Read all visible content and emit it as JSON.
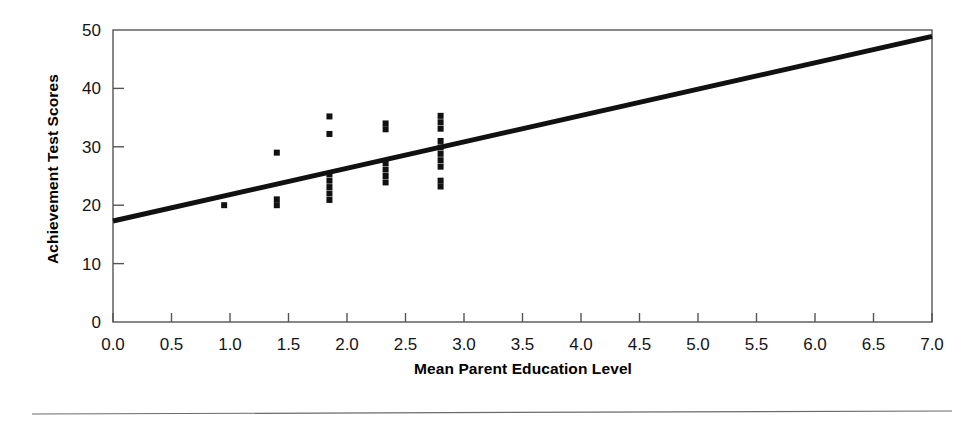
{
  "chart_data": {
    "type": "scatter",
    "title": "",
    "xlabel": "Mean Parent Education Level",
    "ylabel": "Achievement Test Scores",
    "xlim": [
      0.0,
      7.0
    ],
    "ylim": [
      0,
      50
    ],
    "grid": false,
    "legend": null,
    "x_ticks": [
      "0.0",
      "0.5",
      "1.0",
      "1.5",
      "2.0",
      "2.5",
      "3.0",
      "3.5",
      "4.0",
      "4.5",
      "5.0",
      "5.5",
      "6.0",
      "6.5",
      "7.0"
    ],
    "x_tick_values": [
      0.0,
      0.5,
      1.0,
      1.5,
      2.0,
      2.5,
      3.0,
      3.5,
      4.0,
      4.5,
      5.0,
      5.5,
      6.0,
      6.5,
      7.0
    ],
    "y_ticks": [
      "0",
      "10",
      "20",
      "30",
      "40",
      "50"
    ],
    "y_tick_values": [
      0,
      10,
      20,
      30,
      40,
      50
    ],
    "marker": "square",
    "marker_color": "#111111",
    "marker_size_px": 6,
    "points": [
      {
        "x": 0.95,
        "y": 20.0
      },
      {
        "x": 1.4,
        "y": 29.0
      },
      {
        "x": 1.4,
        "y": 21.0
      },
      {
        "x": 1.4,
        "y": 20.0
      },
      {
        "x": 1.85,
        "y": 35.2
      },
      {
        "x": 1.85,
        "y": 32.2
      },
      {
        "x": 1.85,
        "y": 25.3
      },
      {
        "x": 1.85,
        "y": 24.2
      },
      {
        "x": 1.85,
        "y": 23.1
      },
      {
        "x": 1.85,
        "y": 22.0
      },
      {
        "x": 1.85,
        "y": 20.9
      },
      {
        "x": 2.33,
        "y": 34.0
      },
      {
        "x": 2.33,
        "y": 33.0
      },
      {
        "x": 2.33,
        "y": 27.2
      },
      {
        "x": 2.33,
        "y": 26.1
      },
      {
        "x": 2.33,
        "y": 25.0
      },
      {
        "x": 2.33,
        "y": 23.9
      },
      {
        "x": 2.8,
        "y": 35.3
      },
      {
        "x": 2.8,
        "y": 34.2
      },
      {
        "x": 2.8,
        "y": 33.1
      },
      {
        "x": 2.8,
        "y": 31.0
      },
      {
        "x": 2.8,
        "y": 29.9
      },
      {
        "x": 2.8,
        "y": 28.8
      },
      {
        "x": 2.8,
        "y": 27.7
      },
      {
        "x": 2.8,
        "y": 26.6
      },
      {
        "x": 2.8,
        "y": 24.2
      },
      {
        "x": 2.8,
        "y": 23.2
      }
    ],
    "regression_line": {
      "color": "#111111",
      "width_px": 5,
      "x_start": 0.0,
      "y_start": 17.3,
      "x_end": 7.0,
      "y_end": 48.9
    },
    "frame": {
      "color": "#555555",
      "width_px": 1.4,
      "visible": true
    },
    "footer_rule": {
      "visible": true,
      "color": "#6b6b6b"
    }
  }
}
